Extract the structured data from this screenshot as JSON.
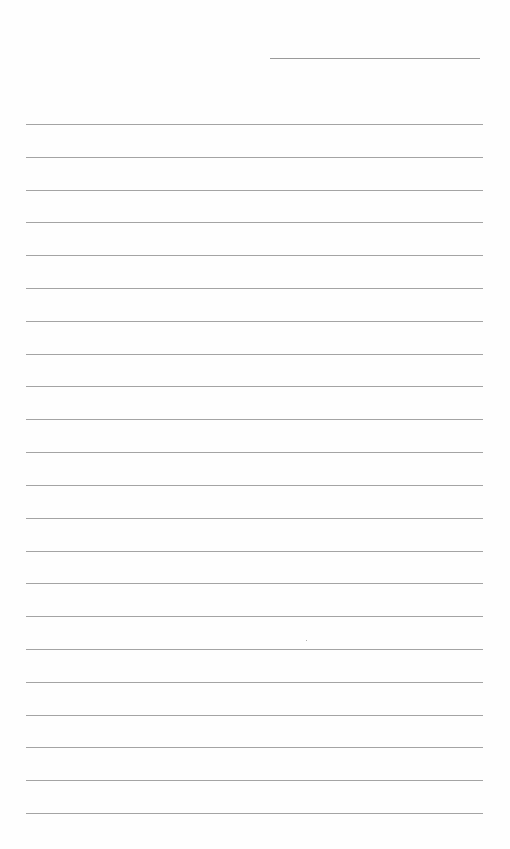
{
  "page": {
    "type": "lined-paper",
    "background_color": "#fefefe",
    "line_color": "#a4a4a4",
    "header_line": {
      "label": "",
      "present": true
    },
    "ruled_line_count": 22,
    "ruled_lines": [
      "",
      "",
      "",
      "",
      "",
      "",
      "",
      "",
      "",
      "",
      "",
      "",
      "",
      "",
      "",
      "",
      "",
      "",
      "",
      "",
      "",
      ""
    ]
  }
}
